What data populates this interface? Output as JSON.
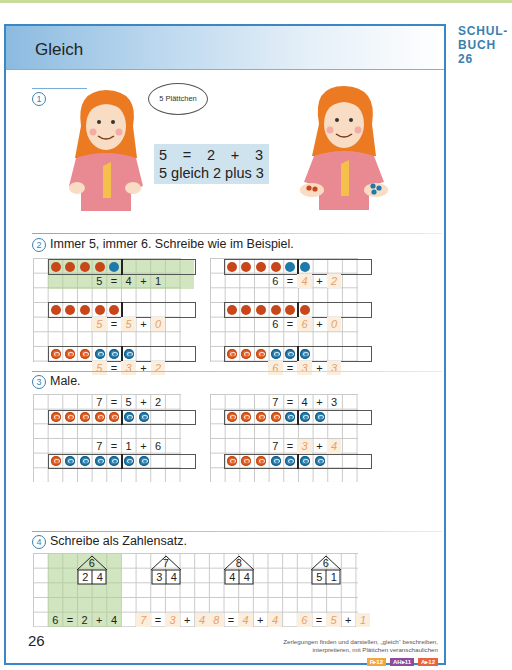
{
  "side_label": {
    "line1": "SCHUL-",
    "line2": "BUCH 26"
  },
  "header": {
    "title": "Gleich"
  },
  "task1": {
    "number": "1",
    "speech_bubble": "5 Plättchen",
    "equation": {
      "parts": [
        "5",
        "=",
        "2",
        "+",
        "3"
      ],
      "words": "5 gleich 2 plus 3"
    }
  },
  "task2": {
    "number": "2",
    "instruction": "Immer 5, immer 6. Schreibe wie im Beispiel.",
    "rows": [
      {
        "dots": [
          "red",
          "red",
          "red",
          "red",
          "blue"
        ],
        "eq": [
          "5",
          "=",
          "4",
          "+",
          "1"
        ],
        "handwritten": [
          false,
          false,
          false,
          false,
          false
        ],
        "highlight": true
      },
      {
        "dots": [
          "red",
          "red",
          "red",
          "red",
          "blue",
          "blue"
        ],
        "eq": [
          "6",
          "=",
          "4",
          "+",
          "2"
        ],
        "handwritten": [
          false,
          false,
          true,
          false,
          true
        ]
      },
      {
        "dots": [
          "red",
          "red",
          "red",
          "red",
          "red"
        ],
        "eq": [
          "5",
          "=",
          "5",
          "+",
          "0"
        ],
        "handwritten": [
          true,
          false,
          true,
          false,
          true
        ]
      },
      {
        "dots": [
          "red",
          "red",
          "red",
          "red",
          "red",
          "red"
        ],
        "eq": [
          "6",
          "=",
          "6",
          "+",
          "0"
        ],
        "handwritten": [
          false,
          false,
          true,
          false,
          true
        ]
      },
      {
        "dots": [
          "ored",
          "ored",
          "ored",
          "oblue",
          "oblue",
          "oblue"
        ],
        "eq": [
          "5",
          "=",
          "3",
          "+",
          "2"
        ],
        "handwritten": [
          true,
          false,
          true,
          false,
          true
        ]
      },
      {
        "dots": [
          "ored",
          "ored",
          "ored",
          "oblue",
          "oblue",
          "oblue"
        ],
        "eq": [
          "6",
          "=",
          "3",
          "+",
          "3"
        ],
        "handwritten": [
          true,
          false,
          true,
          false,
          true
        ]
      }
    ]
  },
  "task3": {
    "number": "3",
    "instruction": "Male.",
    "rows": [
      {
        "eq": [
          "7",
          "=",
          "5",
          "+",
          "2"
        ],
        "dots": [
          "ored",
          "ored",
          "ored",
          "ored",
          "ored",
          "oblue",
          "oblue"
        ],
        "handwritten": [
          false,
          false,
          false,
          false,
          false
        ]
      },
      {
        "eq": [
          "7",
          "=",
          "4",
          "+",
          "3"
        ],
        "dots": [
          "ored",
          "ored",
          "ored",
          "ored",
          "oblue",
          "oblue",
          "oblue"
        ],
        "handwritten": [
          false,
          false,
          false,
          false,
          false
        ]
      },
      {
        "eq": [
          "7",
          "=",
          "1",
          "+",
          "6"
        ],
        "dots": [
          "ored",
          "oblue",
          "oblue",
          "oblue",
          "oblue",
          "oblue",
          "oblue"
        ],
        "handwritten": [
          false,
          false,
          false,
          false,
          false
        ]
      },
      {
        "eq": [
          "7",
          "=",
          "3",
          "+",
          "4"
        ],
        "dots": [
          "ored",
          "ored",
          "ored",
          "oblue",
          "oblue",
          "oblue",
          "oblue"
        ],
        "handwritten": [
          false,
          false,
          true,
          false,
          true
        ]
      }
    ]
  },
  "task4": {
    "number": "4",
    "instruction": "Schreibe als Zahlensatz.",
    "houses": [
      {
        "roof": "6",
        "left": "2",
        "right": "4",
        "eq": [
          "6",
          "=",
          "2",
          "+",
          "4"
        ],
        "handwritten": [
          false,
          false,
          false,
          false,
          false
        ],
        "highlight": true
      },
      {
        "roof": "7",
        "left": "3",
        "right": "4",
        "eq": [
          "7",
          "=",
          "3",
          "+",
          "4"
        ],
        "handwritten": [
          true,
          false,
          true,
          false,
          true
        ]
      },
      {
        "roof": "8",
        "left": "4",
        "right": "4",
        "eq": [
          "8",
          "=",
          "4",
          "+",
          "4"
        ],
        "handwritten": [
          true,
          false,
          true,
          false,
          true
        ]
      },
      {
        "roof": "6",
        "left": "5",
        "right": "1",
        "eq": [
          "6",
          "=",
          "5",
          "+",
          "1"
        ],
        "handwritten": [
          true,
          false,
          true,
          false,
          true
        ]
      }
    ]
  },
  "footer": {
    "page_number": "26",
    "note_line1": "Zerlegungen finden und darstellen, „gleich“ beschreiben,",
    "note_line2": "interpretieren, mit Plättchen veranschaulichen",
    "badges": [
      {
        "label": "F▸12",
        "color": "#f2a63f"
      },
      {
        "label": "AH▸11",
        "color": "#8e4a9c"
      },
      {
        "label": "A▸12",
        "color": "#e8643c"
      }
    ]
  },
  "colors": {
    "accent_blue": "#3b86c4",
    "red_counter": "#c8471a",
    "blue_counter": "#1f7aab",
    "highlight_green": "#c3dcac",
    "handwriting": "#e9a066"
  }
}
